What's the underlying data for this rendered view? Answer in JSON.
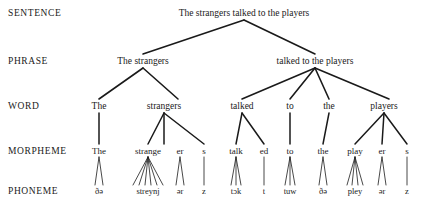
{
  "diagram": {
    "ink_color": "#1a1a1a",
    "background_color": "#ffffff",
    "levels": [
      {
        "id": "sentence",
        "label": "SENTENCE",
        "label_x": 8,
        "y": 14
      },
      {
        "id": "phrase",
        "label": "PHRASE",
        "label_x": 8,
        "y": 62
      },
      {
        "id": "word",
        "label": "WORD",
        "label_x": 8,
        "y": 107
      },
      {
        "id": "morpheme",
        "label": "MORPHEME",
        "label_x": 8,
        "y": 152
      },
      {
        "id": "phoneme",
        "label": "PHONEME",
        "label_x": 8,
        "y": 192
      }
    ],
    "nodes": {
      "sentence": [
        {
          "text": "The strangers talked to the players",
          "x": 244,
          "y": 14
        }
      ],
      "phrase": [
        {
          "text": "The strangers",
          "x": 143,
          "y": 62
        },
        {
          "text": "talked to the players",
          "x": 315,
          "y": 62
        }
      ],
      "word": [
        {
          "text": "The",
          "x": 99,
          "y": 107
        },
        {
          "text": "strangers",
          "x": 164,
          "y": 107
        },
        {
          "text": "talked",
          "x": 242,
          "y": 107
        },
        {
          "text": "to",
          "x": 290,
          "y": 107
        },
        {
          "text": "the",
          "x": 329,
          "y": 107
        },
        {
          "text": "players",
          "x": 384,
          "y": 107
        }
      ],
      "morpheme": [
        {
          "text": "The",
          "x": 99,
          "y": 152
        },
        {
          "text": "strange",
          "x": 148,
          "y": 152
        },
        {
          "text": "er",
          "x": 180,
          "y": 152
        },
        {
          "text": "s",
          "x": 204,
          "y": 152
        },
        {
          "text": "talk",
          "x": 236,
          "y": 152
        },
        {
          "text": "ed",
          "x": 264,
          "y": 152
        },
        {
          "text": "to",
          "x": 290,
          "y": 152
        },
        {
          "text": "the",
          "x": 323,
          "y": 152
        },
        {
          "text": "play",
          "x": 355,
          "y": 152
        },
        {
          "text": "er",
          "x": 382,
          "y": 152
        },
        {
          "text": "s",
          "x": 407,
          "y": 152
        }
      ],
      "phoneme": [
        {
          "text": "ðə",
          "x": 99,
          "y": 192
        },
        {
          "text": "streynj",
          "x": 148,
          "y": 192
        },
        {
          "text": "ər",
          "x": 180,
          "y": 192
        },
        {
          "text": "z",
          "x": 204,
          "y": 192
        },
        {
          "text": "tɔk",
          "x": 236,
          "y": 192
        },
        {
          "text": "t",
          "x": 264,
          "y": 192
        },
        {
          "text": "tuw",
          "x": 290,
          "y": 192
        },
        {
          "text": "ðə",
          "x": 323,
          "y": 192
        },
        {
          "text": "pley",
          "x": 355,
          "y": 192
        },
        {
          "text": "ər",
          "x": 382,
          "y": 192
        },
        {
          "text": "z",
          "x": 407,
          "y": 192
        }
      ]
    },
    "edges": [
      {
        "group": "sentence-to-phrase",
        "x1": 244,
        "y1": 20,
        "x2": 143,
        "y2": 54,
        "w": 1.6
      },
      {
        "group": "sentence-to-phrase",
        "x1": 244,
        "y1": 20,
        "x2": 315,
        "y2": 54,
        "w": 1.6
      },
      {
        "group": "phrase-to-word",
        "x1": 143,
        "y1": 68,
        "x2": 99,
        "y2": 99,
        "w": 1.6
      },
      {
        "group": "phrase-to-word",
        "x1": 143,
        "y1": 68,
        "x2": 178,
        "y2": 99,
        "w": 1.6
      },
      {
        "group": "phrase-to-word",
        "x1": 315,
        "y1": 68,
        "x2": 242,
        "y2": 99,
        "w": 1.6
      },
      {
        "group": "phrase-to-word",
        "x1": 315,
        "y1": 68,
        "x2": 290,
        "y2": 99,
        "w": 1.6
      },
      {
        "group": "phrase-to-word",
        "x1": 315,
        "y1": 68,
        "x2": 329,
        "y2": 99,
        "w": 1.6
      },
      {
        "group": "phrase-to-word",
        "x1": 315,
        "y1": 68,
        "x2": 389,
        "y2": 99,
        "w": 1.6
      },
      {
        "group": "word-to-morpheme",
        "x1": 99,
        "y1": 113,
        "x2": 99,
        "y2": 144,
        "w": 1.5
      },
      {
        "group": "word-to-morpheme",
        "x1": 164,
        "y1": 113,
        "x2": 148,
        "y2": 144,
        "w": 1.5
      },
      {
        "group": "word-to-morpheme",
        "x1": 164,
        "y1": 113,
        "x2": 164,
        "y2": 144,
        "w": 1.5
      },
      {
        "group": "word-to-morpheme",
        "x1": 164,
        "y1": 113,
        "x2": 204,
        "y2": 144,
        "w": 1.5
      },
      {
        "group": "word-to-morpheme",
        "x1": 242,
        "y1": 113,
        "x2": 236,
        "y2": 144,
        "w": 1.5
      },
      {
        "group": "word-to-morpheme",
        "x1": 242,
        "y1": 113,
        "x2": 264,
        "y2": 144,
        "w": 1.5
      },
      {
        "group": "word-to-morpheme",
        "x1": 290,
        "y1": 113,
        "x2": 290,
        "y2": 144,
        "w": 1.5
      },
      {
        "group": "word-to-morpheme",
        "x1": 329,
        "y1": 113,
        "x2": 323,
        "y2": 144,
        "w": 1.5
      },
      {
        "group": "word-to-morpheme",
        "x1": 384,
        "y1": 113,
        "x2": 355,
        "y2": 144,
        "w": 1.5
      },
      {
        "group": "word-to-morpheme",
        "x1": 384,
        "y1": 113,
        "x2": 382,
        "y2": 144,
        "w": 1.5
      },
      {
        "group": "word-to-morpheme",
        "x1": 384,
        "y1": 113,
        "x2": 407,
        "y2": 144,
        "w": 1.5
      },
      {
        "group": "morpheme-to-phoneme",
        "x1": 99,
        "y1": 157,
        "x2": 95,
        "y2": 185,
        "w": 0.8
      },
      {
        "group": "morpheme-to-phoneme",
        "x1": 99,
        "y1": 157,
        "x2": 103,
        "y2": 185,
        "w": 0.8
      },
      {
        "group": "morpheme-to-phoneme",
        "x1": 148,
        "y1": 157,
        "x2": 133,
        "y2": 185,
        "w": 0.8
      },
      {
        "group": "morpheme-to-phoneme",
        "x1": 148,
        "y1": 157,
        "x2": 139,
        "y2": 185,
        "w": 0.8
      },
      {
        "group": "morpheme-to-phoneme",
        "x1": 148,
        "y1": 157,
        "x2": 145,
        "y2": 185,
        "w": 0.8
      },
      {
        "group": "morpheme-to-phoneme",
        "x1": 148,
        "y1": 157,
        "x2": 151,
        "y2": 185,
        "w": 0.8
      },
      {
        "group": "morpheme-to-phoneme",
        "x1": 148,
        "y1": 157,
        "x2": 157,
        "y2": 185,
        "w": 0.8
      },
      {
        "group": "morpheme-to-phoneme",
        "x1": 148,
        "y1": 157,
        "x2": 163,
        "y2": 185,
        "w": 0.8
      },
      {
        "group": "morpheme-to-phoneme",
        "x1": 180,
        "y1": 157,
        "x2": 176,
        "y2": 185,
        "w": 0.8
      },
      {
        "group": "morpheme-to-phoneme",
        "x1": 180,
        "y1": 157,
        "x2": 184,
        "y2": 185,
        "w": 0.8
      },
      {
        "group": "morpheme-to-phoneme",
        "x1": 204,
        "y1": 157,
        "x2": 204,
        "y2": 185,
        "w": 0.8
      },
      {
        "group": "morpheme-to-phoneme",
        "x1": 236,
        "y1": 157,
        "x2": 231,
        "y2": 185,
        "w": 0.8
      },
      {
        "group": "morpheme-to-phoneme",
        "x1": 236,
        "y1": 157,
        "x2": 236,
        "y2": 185,
        "w": 0.8
      },
      {
        "group": "morpheme-to-phoneme",
        "x1": 236,
        "y1": 157,
        "x2": 241,
        "y2": 185,
        "w": 0.8
      },
      {
        "group": "morpheme-to-phoneme",
        "x1": 264,
        "y1": 157,
        "x2": 264,
        "y2": 185,
        "w": 0.8
      },
      {
        "group": "morpheme-to-phoneme",
        "x1": 290,
        "y1": 157,
        "x2": 285,
        "y2": 185,
        "w": 0.8
      },
      {
        "group": "morpheme-to-phoneme",
        "x1": 290,
        "y1": 157,
        "x2": 290,
        "y2": 185,
        "w": 0.8
      },
      {
        "group": "morpheme-to-phoneme",
        "x1": 290,
        "y1": 157,
        "x2": 295,
        "y2": 185,
        "w": 0.8
      },
      {
        "group": "morpheme-to-phoneme",
        "x1": 323,
        "y1": 157,
        "x2": 319,
        "y2": 185,
        "w": 0.8
      },
      {
        "group": "morpheme-to-phoneme",
        "x1": 323,
        "y1": 157,
        "x2": 327,
        "y2": 185,
        "w": 0.8
      },
      {
        "group": "morpheme-to-phoneme",
        "x1": 355,
        "y1": 157,
        "x2": 347,
        "y2": 185,
        "w": 0.8
      },
      {
        "group": "morpheme-to-phoneme",
        "x1": 355,
        "y1": 157,
        "x2": 352,
        "y2": 185,
        "w": 0.8
      },
      {
        "group": "morpheme-to-phoneme",
        "x1": 355,
        "y1": 157,
        "x2": 358,
        "y2": 185,
        "w": 0.8
      },
      {
        "group": "morpheme-to-phoneme",
        "x1": 355,
        "y1": 157,
        "x2": 363,
        "y2": 185,
        "w": 0.8
      },
      {
        "group": "morpheme-to-phoneme",
        "x1": 382,
        "y1": 157,
        "x2": 378,
        "y2": 185,
        "w": 0.8
      },
      {
        "group": "morpheme-to-phoneme",
        "x1": 382,
        "y1": 157,
        "x2": 386,
        "y2": 185,
        "w": 0.8
      },
      {
        "group": "morpheme-to-phoneme",
        "x1": 407,
        "y1": 157,
        "x2": 407,
        "y2": 185,
        "w": 0.8
      }
    ]
  }
}
